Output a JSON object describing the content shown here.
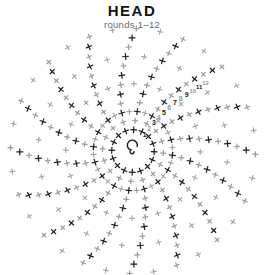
{
  "header": {
    "title": "HEAD",
    "subtitle": "rounds 1–12"
  },
  "diagram": {
    "type": "crochet-chart",
    "center": [
      133,
      151
    ],
    "start": "magic-ring",
    "spokes": 16,
    "rounds": 12,
    "stitch_symbol": "single-crochet-x",
    "colors": {
      "odd_round": "#1a1a1a",
      "even_round": "#9a9a9a",
      "ring": "#1a1a1a"
    },
    "round_labels": [
      "1",
      "2",
      "3",
      "4",
      "5",
      "6",
      "7",
      "8",
      "9",
      "10",
      "11",
      "12"
    ]
  }
}
